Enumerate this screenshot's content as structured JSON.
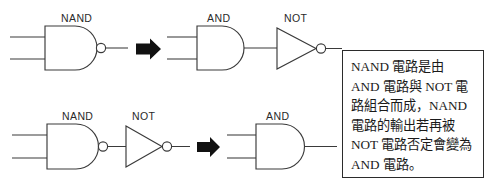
{
  "diagram": {
    "stroke_color": "#3a3a3a",
    "arrow_color": "#111111",
    "box_border_color": "#2b2b2b",
    "background": "#ffffff",
    "rows": [
      {
        "id": "row-top",
        "gates": [
          {
            "id": "nand-top",
            "type": "nand",
            "label": "NAND"
          },
          {
            "id": "and-top",
            "type": "and",
            "label": "AND"
          },
          {
            "id": "not-top",
            "type": "not",
            "label": "NOT"
          }
        ],
        "arrow": {
          "id": "arrow-top",
          "glyph": "right-arrow"
        }
      },
      {
        "id": "row-bottom",
        "gates": [
          {
            "id": "nand-bottom",
            "type": "nand",
            "label": "NAND"
          },
          {
            "id": "not-bottom",
            "type": "not",
            "label": "NOT"
          },
          {
            "id": "and-bottom",
            "type": "and",
            "label": "AND"
          }
        ],
        "arrow": {
          "id": "arrow-bottom",
          "glyph": "right-arrow"
        }
      }
    ]
  },
  "callout": {
    "lines": [
      "NAND 電路是由",
      "AND 電路與 NOT 電",
      "路組合而成，NAND",
      "電路的輸出若再被",
      "NOT 電路否定會變為",
      "AND 電路。"
    ]
  }
}
